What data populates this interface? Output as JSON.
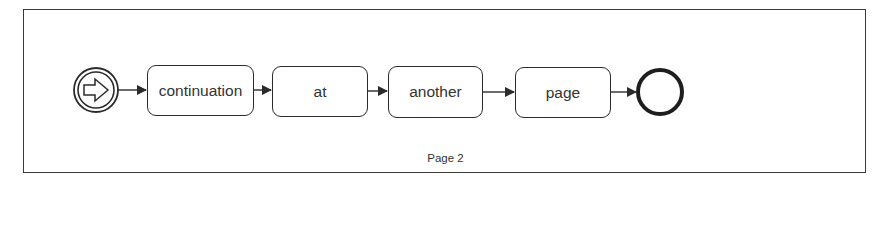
{
  "diagram": {
    "type": "bpmn-process",
    "start_event": {
      "kind": "link-catch",
      "icon": "arrow-right-icon"
    },
    "tasks": [
      {
        "label": "continuation"
      },
      {
        "label": "at"
      },
      {
        "label": "another"
      },
      {
        "label": "page"
      }
    ],
    "end_event": {
      "kind": "none-end"
    },
    "page_label": "Page 2",
    "colors": {
      "stroke": "#2b2b2b",
      "text": "#333333",
      "frame": "#3a3a3a",
      "background": "#ffffff"
    }
  }
}
